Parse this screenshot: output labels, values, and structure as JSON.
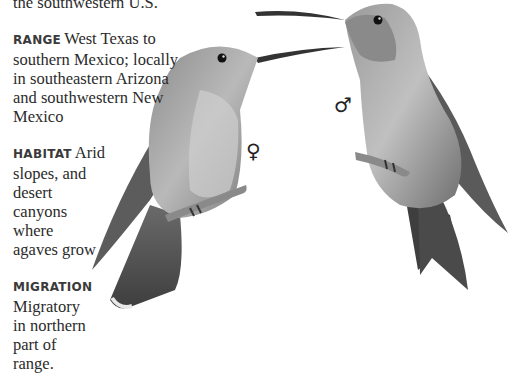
{
  "intro": {
    "text": "the southwestern U.S."
  },
  "sections": [
    {
      "label": "RANGE",
      "text": "West Texas to southern Mexico; locally in southeastern Arizona and southwestern New Mexico"
    },
    {
      "label": "HABITAT",
      "text": "Arid slopes, and desert canyons where agaves grow"
    },
    {
      "label": "MIGRATION",
      "text": "Migratory in northern part of range."
    }
  ],
  "illustration": {
    "female_symbol": "♀",
    "male_symbol": "♂",
    "female_label": "female hummingbird",
    "male_label": "male hummingbird"
  }
}
